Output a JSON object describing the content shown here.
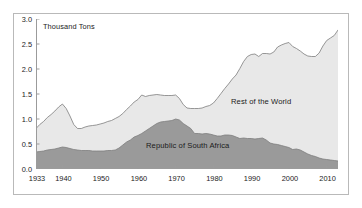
{
  "chart_data": {
    "type": "area",
    "stacked": true,
    "title": "",
    "subtitle": "",
    "xlabel": "",
    "ylabel": "Thousand Tons",
    "axis_unit_label": "Thousand Tons",
    "xlim": [
      1933,
      2013
    ],
    "ylim": [
      0.0,
      3.0
    ],
    "grid": false,
    "legend_position": "inline-annotations",
    "ytick_labels": [
      "0.0",
      "0.5",
      "1.0",
      "1.5",
      "2.0",
      "2.5",
      "3.0"
    ],
    "ytick_values": [
      0.0,
      0.5,
      1.0,
      1.5,
      2.0,
      2.5,
      3.0
    ],
    "xtick_labels": [
      "1933",
      "1940",
      "1950",
      "1960",
      "1970",
      "1980",
      "1990",
      "2000",
      "2010"
    ],
    "xtick_values": [
      1933,
      1940,
      1950,
      1960,
      1970,
      1980,
      1990,
      2000,
      2010
    ],
    "colors": {
      "republic_of_south_africa": "#9a9a9a",
      "rest_of_the_world": "#e8e8e8",
      "line": "#7d7d7d",
      "axis": "#9b9b9b",
      "text": "#1b1b1b",
      "border": "#b9b9b9"
    },
    "x": [
      1933,
      1934,
      1935,
      1936,
      1937,
      1938,
      1939,
      1940,
      1941,
      1942,
      1943,
      1944,
      1945,
      1946,
      1947,
      1948,
      1949,
      1950,
      1951,
      1952,
      1953,
      1954,
      1955,
      1956,
      1957,
      1958,
      1959,
      1960,
      1961,
      1962,
      1963,
      1964,
      1965,
      1966,
      1967,
      1968,
      1969,
      1970,
      1971,
      1972,
      1973,
      1974,
      1975,
      1976,
      1977,
      1978,
      1979,
      1980,
      1981,
      1982,
      1983,
      1984,
      1985,
      1986,
      1987,
      1988,
      1989,
      1990,
      1991,
      1992,
      1993,
      1994,
      1995,
      1996,
      1997,
      1998,
      1999,
      2000,
      2001,
      2002,
      2003,
      2004,
      2005,
      2006,
      2007,
      2008,
      2009,
      2010,
      2011,
      2012,
      2013
    ],
    "series": [
      {
        "name": "Republic of South Africa",
        "color": "#9a9a9a",
        "values": [
          0.34,
          0.35,
          0.36,
          0.38,
          0.39,
          0.4,
          0.42,
          0.44,
          0.43,
          0.41,
          0.39,
          0.38,
          0.37,
          0.37,
          0.37,
          0.36,
          0.36,
          0.36,
          0.36,
          0.37,
          0.37,
          0.38,
          0.42,
          0.48,
          0.54,
          0.58,
          0.64,
          0.67,
          0.71,
          0.76,
          0.81,
          0.86,
          0.91,
          0.94,
          0.95,
          0.96,
          0.97,
          1.0,
          0.98,
          0.91,
          0.86,
          0.81,
          0.71,
          0.71,
          0.7,
          0.71,
          0.7,
          0.68,
          0.66,
          0.66,
          0.68,
          0.68,
          0.67,
          0.64,
          0.61,
          0.62,
          0.61,
          0.61,
          0.6,
          0.61,
          0.62,
          0.58,
          0.52,
          0.5,
          0.49,
          0.47,
          0.45,
          0.43,
          0.39,
          0.4,
          0.38,
          0.34,
          0.3,
          0.27,
          0.25,
          0.22,
          0.2,
          0.19,
          0.18,
          0.17,
          0.16
        ]
      },
      {
        "name": "Rest of the World",
        "color": "#e8e8e8",
        "values": [
          0.47,
          0.54,
          0.59,
          0.65,
          0.7,
          0.76,
          0.82,
          0.86,
          0.78,
          0.65,
          0.5,
          0.43,
          0.44,
          0.47,
          0.49,
          0.51,
          0.52,
          0.54,
          0.56,
          0.58,
          0.6,
          0.63,
          0.63,
          0.63,
          0.65,
          0.68,
          0.7,
          0.72,
          0.77,
          0.69,
          0.66,
          0.62,
          0.58,
          0.54,
          0.52,
          0.51,
          0.5,
          0.48,
          0.43,
          0.38,
          0.36,
          0.4,
          0.5,
          0.5,
          0.52,
          0.54,
          0.57,
          0.64,
          0.75,
          0.85,
          0.93,
          1.02,
          1.13,
          1.24,
          1.4,
          1.53,
          1.64,
          1.68,
          1.7,
          1.64,
          1.69,
          1.73,
          1.78,
          1.84,
          1.95,
          2.01,
          2.06,
          2.1,
          2.06,
          2.01,
          1.98,
          1.96,
          1.96,
          1.98,
          2.0,
          2.1,
          2.26,
          2.38,
          2.44,
          2.5,
          2.62
        ]
      }
    ],
    "totals": [
      0.81,
      0.89,
      0.95,
      1.03,
      1.09,
      1.16,
      1.24,
      1.3,
      1.21,
      1.06,
      0.89,
      0.81,
      0.81,
      0.84,
      0.86,
      0.87,
      0.88,
      0.9,
      0.92,
      0.95,
      0.97,
      1.01,
      1.05,
      1.11,
      1.19,
      1.26,
      1.34,
      1.39,
      1.48,
      1.45,
      1.47,
      1.48,
      1.49,
      1.48,
      1.47,
      1.47,
      1.47,
      1.48,
      1.41,
      1.29,
      1.22,
      1.21,
      1.21,
      1.21,
      1.22,
      1.25,
      1.27,
      1.32,
      1.41,
      1.51,
      1.61,
      1.7,
      1.8,
      1.88,
      2.01,
      2.15,
      2.25,
      2.29,
      2.3,
      2.25,
      2.31,
      2.31,
      2.3,
      2.34,
      2.44,
      2.48,
      2.51,
      2.53,
      2.45,
      2.41,
      2.36,
      2.3,
      2.26,
      2.25,
      2.25,
      2.32,
      2.46,
      2.57,
      2.62,
      2.67,
      2.78
    ],
    "annotations": [
      {
        "text": "Rest of the World",
        "x": 1994,
        "y": 1.72
      },
      {
        "text": "Republic of South Africa",
        "x": 1968,
        "y": 0.3
      },
      {
        "text": "Thousand Tons",
        "x": 1935,
        "y": 2.88
      }
    ]
  }
}
